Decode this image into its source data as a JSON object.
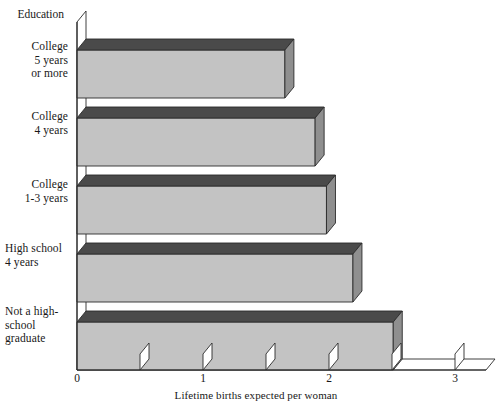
{
  "chart_data": {
    "type": "bar",
    "orientation": "horizontal",
    "style": "3d-block-bars",
    "title": "",
    "xlabel": "Lifetime births expected per woman",
    "ylabel": "Education",
    "categories": [
      "College\n5 years\nor more",
      "College\n4 years",
      "College\n1-3 years",
      "High school\n4 years",
      "Not a high-\nschool\ngraduate"
    ],
    "values": [
      1.65,
      1.89,
      1.98,
      2.19,
      2.51
    ],
    "xlim": [
      0,
      3.2
    ],
    "xticks": [
      0,
      0.5,
      1,
      1.5,
      2,
      2.5,
      3
    ],
    "xtick_labels": [
      "0",
      "",
      "1",
      "",
      "2",
      "",
      "3"
    ],
    "major_tick_labels": [
      "0",
      "1",
      "2",
      "3"
    ],
    "grid": false,
    "legend": false,
    "colors": {
      "bar_face": "#c3c3c3",
      "bar_top": "#4a4a4a",
      "bar_side": "#8f8f8f",
      "axis_line": "#2b2b2b",
      "background": "#ffffff",
      "text": "#181818"
    }
  },
  "axis": {
    "y_title": "Education",
    "x_title": "Lifetime births expected per woman",
    "ticks": [
      {
        "value": "0",
        "label": "0"
      },
      {
        "value": "0.5",
        "label": ""
      },
      {
        "value": "1",
        "label": "1"
      },
      {
        "value": "1.5",
        "label": ""
      },
      {
        "value": "2",
        "label": "2"
      },
      {
        "value": "2.5",
        "label": ""
      },
      {
        "value": "3",
        "label": "3"
      }
    ]
  },
  "categories": [
    {
      "label": "College\n5 years\nor more",
      "align": "right"
    },
    {
      "label": "College\n4 years",
      "align": "right"
    },
    {
      "label": "College\n1-3 years",
      "align": "right"
    },
    {
      "label": "High school\n4 years",
      "align": "left"
    },
    {
      "label": "Not a high-\nschool\ngraduate",
      "align": "left"
    }
  ]
}
